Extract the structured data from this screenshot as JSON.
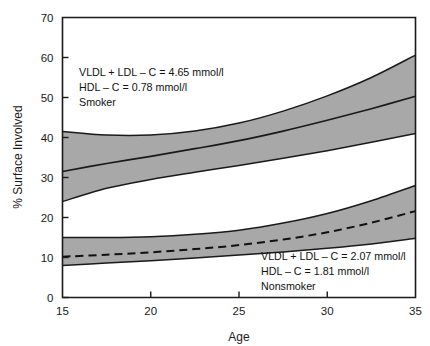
{
  "chart_data": {
    "type": "area",
    "title": "",
    "subtitle": "",
    "xlabel": "Age",
    "ylabel": "% Surface Involved",
    "xlim": [
      15,
      35
    ],
    "ylim": [
      0,
      70
    ],
    "xticks": [
      15,
      20,
      25,
      30,
      35
    ],
    "yticks": [
      0,
      10,
      20,
      30,
      40,
      50,
      60,
      70
    ],
    "grid": false,
    "legend_position": "none",
    "band_fill_color": "#a8a8a8",
    "line_color": "#1a1a1a",
    "series": [
      {
        "name": "Smoker",
        "line_style": "solid",
        "x": [
          15,
          17.5,
          20,
          22.5,
          25,
          27.5,
          30,
          32.5,
          35
        ],
        "values": [
          31.5,
          33.5,
          35.3,
          37.2,
          39.2,
          41.6,
          44.3,
          47.2,
          50.3
        ],
        "band_upper": [
          41.5,
          40.6,
          40.6,
          41.6,
          43.6,
          46.6,
          50.4,
          55.0,
          60.6
        ],
        "band_lower": [
          24.0,
          27.3,
          29.5,
          31.3,
          33.0,
          34.8,
          36.7,
          38.8,
          41.0
        ]
      },
      {
        "name": "Nonsmoker",
        "line_style": "dashed",
        "x": [
          15,
          17.5,
          20,
          22.5,
          25,
          27.5,
          30,
          32.5,
          35
        ],
        "values": [
          10.2,
          10.7,
          11.3,
          12.1,
          13.1,
          14.5,
          16.3,
          18.7,
          21.6
        ],
        "band_upper": [
          15.0,
          15.0,
          15.2,
          15.8,
          16.8,
          18.6,
          21.0,
          24.2,
          28.0
        ],
        "band_lower": [
          8.0,
          8.6,
          9.2,
          9.9,
          10.6,
          11.4,
          12.3,
          13.4,
          14.8
        ]
      }
    ],
    "annotations": [
      {
        "id": "smoker-annotation",
        "lines": [
          "VLDL + LDL – C = 4.65 mmol/l",
          "HDL – C = 0.78 mmol/l",
          "Smoker"
        ],
        "x": 16.3,
        "y": 56.0
      },
      {
        "id": "nonsmoker-annotation",
        "lines": [
          "VLDL + LDL – C = 2.07 mmol/l",
          "HDL – C = 1.81 mmol/l",
          "Nonsmoker"
        ],
        "x": 25.4,
        "y": 11.6
      }
    ]
  },
  "axes": {
    "y_title": "% Surface Involved",
    "x_title": "Age",
    "y_tick_labels": [
      "0",
      "10",
      "20",
      "30",
      "40",
      "50",
      "60",
      "70"
    ],
    "x_tick_labels": [
      "15",
      "20",
      "25",
      "30",
      "35"
    ]
  },
  "annotation_text": {
    "smoker": {
      "line1": "VLDL + LDL – C = 4.65 mmol/l",
      "line2": "HDL – C = 0.78 mmol/l",
      "line3": "Smoker"
    },
    "nonsmoker": {
      "line1": "VLDL + LDL – C = 2.07 mmol/l",
      "line2": "HDL – C = 1.81 mmol/l",
      "line3": "Nonsmoker"
    }
  }
}
